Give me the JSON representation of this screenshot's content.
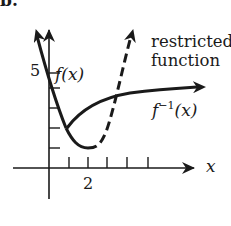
{
  "figure": {
    "part_label": "b.",
    "x_axis_label": "x",
    "x_tick_labels": [
      {
        "value": "2",
        "position": 2
      }
    ],
    "y_tick_labels": [
      {
        "value": "5",
        "position": 5
      }
    ],
    "curves": {
      "f": {
        "name": "f(x)",
        "label_main": "f",
        "label_arg": "(x)",
        "style": "solid"
      },
      "f_inverse": {
        "name": "f^-1(x)",
        "label_main": "f",
        "label_sup": "−1",
        "label_arg": "(x)",
        "style": "solid"
      },
      "restricted": {
        "label_line1": "restricted",
        "label_line2": "function",
        "style": "dashed"
      }
    },
    "colors": {
      "ink": "#1a1a1a",
      "background": "#ffffff"
    }
  }
}
